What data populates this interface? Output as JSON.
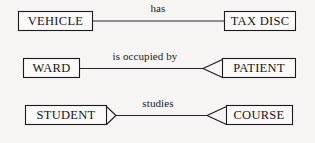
{
  "diagram": {
    "background_color": "#f6f5f3",
    "line_color": "#24242a",
    "box_fill_color": "#fbfaf8",
    "notation": "arrow / chevron cardinality notation",
    "relationships": [
      {
        "id": "vehicle-has-tax-disc",
        "left_entity": "VEHICLE",
        "right_entity": "TAX DISC",
        "label": "has",
        "left_arrow": "none",
        "right_arrow": "none"
      },
      {
        "id": "ward-is-occupied-by-patient",
        "left_entity": "WARD",
        "right_entity": "PATIENT",
        "label": "is occupied by",
        "left_arrow": "none",
        "right_arrow": "chevron-left"
      },
      {
        "id": "student-studies-course",
        "left_entity": "STUDENT",
        "right_entity": "COURSE",
        "label": "studies",
        "left_arrow": "chevron-right",
        "right_arrow": "chevron-left"
      }
    ]
  }
}
